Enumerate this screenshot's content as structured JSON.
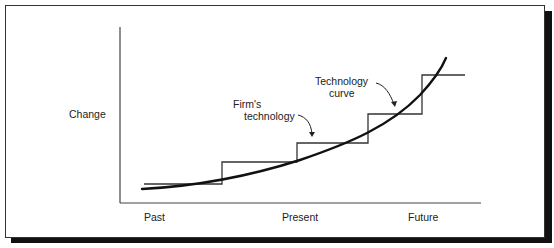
{
  "diagram": {
    "y_axis_label": "Change",
    "x_axis_labels": [
      "Past",
      "Present",
      "Future"
    ],
    "annotations": {
      "firm_technology": [
        "Firm's",
        "technology"
      ],
      "technology_curve": [
        "Technology",
        "curve"
      ]
    },
    "series": [
      {
        "name": "Technology curve",
        "shape": "smooth exponential curve",
        "stroke": "#111111"
      },
      {
        "name": "Firm's technology",
        "shape": "staircase",
        "stroke": "#333333"
      }
    ]
  }
}
